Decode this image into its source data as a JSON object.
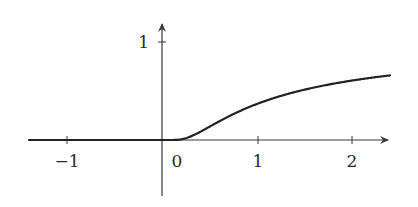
{
  "chart_data": {
    "type": "line",
    "title": "",
    "xlabel": "",
    "ylabel": "",
    "function": "f(x) = e^(-1/x) for x > 0, 0 for x <= 0",
    "xlim": [
      -1.4,
      2.4
    ],
    "ylim": [
      -0.5,
      1.2
    ],
    "grid": false,
    "legend": null,
    "x_ticks": [
      -1,
      0,
      1,
      2
    ],
    "x_tick_labels": [
      "−1",
      "0",
      "1",
      "2"
    ],
    "y_ticks": [
      1
    ],
    "y_tick_labels": [
      "1"
    ],
    "series": [
      {
        "name": "curve",
        "x": [
          -1.4,
          -1,
          -0.5,
          0,
          0.1,
          0.2,
          0.3,
          0.5,
          0.75,
          1,
          1.25,
          1.5,
          1.75,
          2,
          2.2,
          2.4
        ],
        "y": [
          0,
          0,
          0,
          0,
          5e-05,
          0.0067,
          0.036,
          0.135,
          0.264,
          0.368,
          0.449,
          0.513,
          0.565,
          0.607,
          0.635,
          0.659
        ]
      }
    ]
  },
  "colors": {
    "axis": "#3a3a3a",
    "curve": "#222222",
    "background": "#ffffff"
  }
}
